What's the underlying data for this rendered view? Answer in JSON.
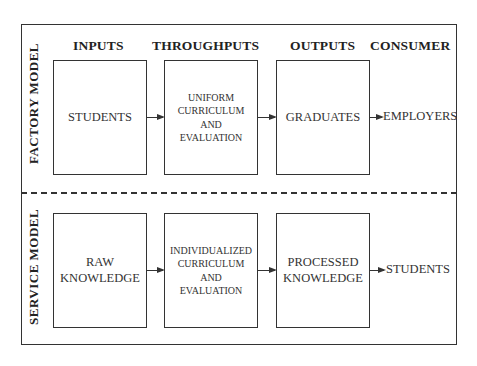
{
  "headers": {
    "inputs": "INPUTS",
    "throughputs": "THROUGHPUTS",
    "outputs": "OUTPUTS",
    "consumer": "CONSUMER"
  },
  "factory": {
    "label": "FACTORY MODEL",
    "input": "STUDENTS",
    "throughput": "UNIFORM\nCURRICULUM\nAND\nEVALUATION",
    "output": "GRADUATES",
    "consumer": "EMPLOYERS"
  },
  "service": {
    "label": "SERVICE MODEL",
    "input": "RAW\nKNOWLEDGE",
    "throughput": "INDIVIDUALIZED\nCURRICULUM\nAND\nEVALUATION",
    "output": "PROCESSED\nKNOWLEDGE",
    "consumer": "STUDENTS"
  }
}
